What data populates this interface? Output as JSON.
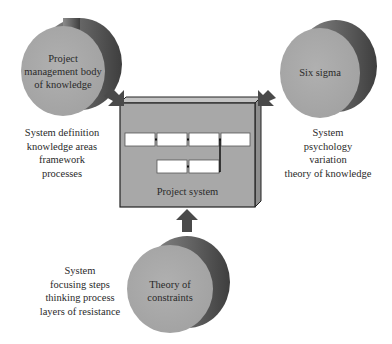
{
  "diagram": {
    "center": {
      "label": "Project system",
      "process_boxes_top_row": 4,
      "process_boxes_bottom_row": 2
    },
    "sources": [
      {
        "id": "pmbok",
        "label_lines": [
          "Project",
          "management body",
          "of knowledge"
        ],
        "caption_lines": [
          "System definition",
          "knowledge areas",
          "framework",
          "processes"
        ],
        "position": "top-left"
      },
      {
        "id": "six-sigma",
        "label_lines": [
          "Six sigma"
        ],
        "caption_lines": [
          "System",
          "psychology",
          "variation",
          "theory of knowledge"
        ],
        "position": "top-right"
      },
      {
        "id": "toc",
        "label_lines": [
          "Theory of",
          "constraints"
        ],
        "caption_lines": [
          "System",
          "focusing steps",
          "thinking process",
          "layers of resistance"
        ],
        "position": "bottom"
      }
    ],
    "colors": {
      "cylinder_face": "#a9a9a9",
      "cylinder_side": "#5a5a5a",
      "box_front": "#a8a8a8",
      "box_top": "#c4c4c4",
      "box_side": "#8a8a8a",
      "arrow": "#4a4a4a",
      "process_box": "#ffffff"
    }
  }
}
